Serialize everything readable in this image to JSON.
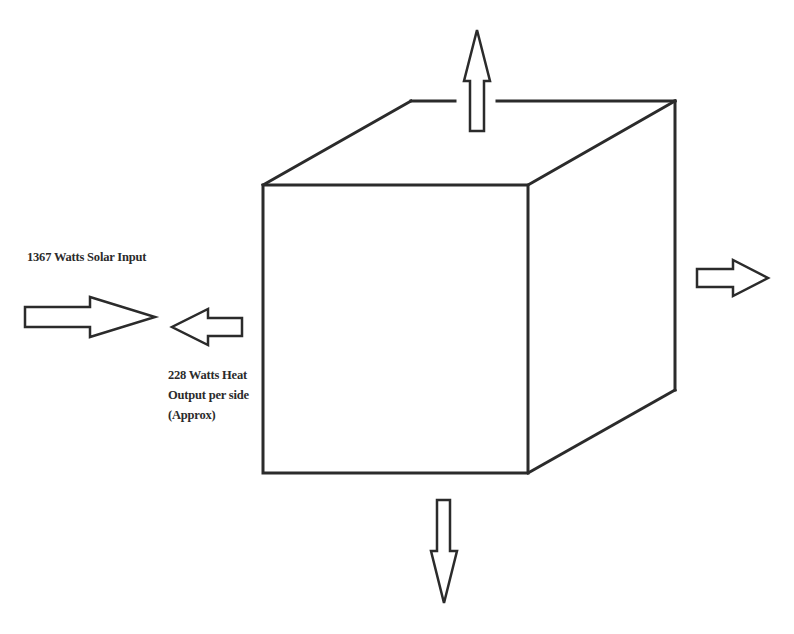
{
  "diagram": {
    "labels": {
      "solar_input": "1367 Watts Solar Input",
      "heat_output_lines": [
        "228 Watts Heat",
        "Output per side",
        "(Approx)"
      ]
    },
    "arrows": [
      {
        "id": "solar-input",
        "direction": "right",
        "meaning": "incoming solar radiation"
      },
      {
        "id": "heat-out-left",
        "direction": "left",
        "meaning": "heat output"
      },
      {
        "id": "heat-out-top",
        "direction": "up",
        "meaning": "heat output"
      },
      {
        "id": "heat-out-right",
        "direction": "right",
        "meaning": "heat output"
      },
      {
        "id": "heat-out-bottom",
        "direction": "down",
        "meaning": "heat output"
      }
    ],
    "colors": {
      "stroke": "#2b2b2b",
      "background": "#ffffff"
    }
  }
}
